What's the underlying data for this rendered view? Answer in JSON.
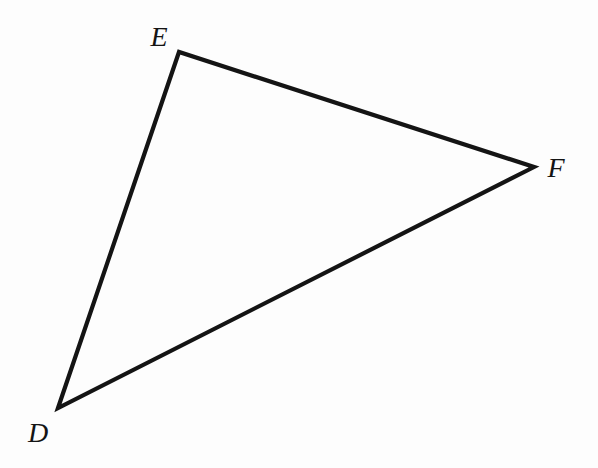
{
  "figure": {
    "kind": "triangle-diagram",
    "canvas": {
      "width": 598,
      "height": 468,
      "background": "#fdfdfd"
    },
    "stroke": {
      "color": "#141414",
      "width": 4.2,
      "linejoin": "miter",
      "linecap": "butt"
    },
    "label_color": "#141414",
    "vertices": [
      {
        "id": "D",
        "label": "D",
        "x": 58,
        "y": 408,
        "label_x": 38,
        "label_y": 433,
        "label_anchor": "below-left"
      },
      {
        "id": "E",
        "label": "E",
        "x": 179,
        "y": 52,
        "label_x": 159,
        "label_y": 37,
        "label_anchor": "above-left"
      },
      {
        "id": "F",
        "label": "F",
        "x": 534,
        "y": 167,
        "label_x": 556,
        "label_y": 168,
        "label_anchor": "right"
      }
    ],
    "edges": [
      {
        "id": "DE",
        "from": "D",
        "to": "E"
      },
      {
        "id": "EF",
        "from": "E",
        "to": "F"
      },
      {
        "id": "FD",
        "from": "F",
        "to": "D"
      }
    ],
    "path": "M 58 408 L 179 52 L 534 167 Z"
  }
}
